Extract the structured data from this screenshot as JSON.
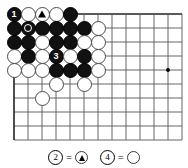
{
  "figure": {
    "kind": "go-board-diagram",
    "board": {
      "cols": 13,
      "rows": 10,
      "origin_x": 14,
      "origin_y": 14,
      "spacing": 14,
      "line_color": "#555555",
      "edge_color": "#222222",
      "background": "#ffffff",
      "star_points": [
        {
          "col": 11,
          "row": 4
        }
      ]
    },
    "stones": [
      {
        "col": 1,
        "row": 1,
        "color": "black",
        "label": "1",
        "mark": "number"
      },
      {
        "col": 2,
        "row": 1,
        "color": "white",
        "label": "",
        "mark": "none"
      },
      {
        "col": 3,
        "row": 1,
        "color": "white",
        "label": "",
        "mark": "triangle"
      },
      {
        "col": 4,
        "row": 1,
        "color": "white",
        "label": "",
        "mark": "none"
      },
      {
        "col": 5,
        "row": 1,
        "color": "black",
        "label": "",
        "mark": "none"
      },
      {
        "col": 1,
        "row": 2,
        "color": "black",
        "label": "",
        "mark": "none"
      },
      {
        "col": 2,
        "row": 2,
        "color": "black",
        "label": "",
        "mark": "circle"
      },
      {
        "col": 3,
        "row": 2,
        "color": "black",
        "label": "",
        "mark": "none"
      },
      {
        "col": 4,
        "row": 2,
        "color": "black",
        "label": "",
        "mark": "none"
      },
      {
        "col": 5,
        "row": 2,
        "color": "black",
        "label": "",
        "mark": "none"
      },
      {
        "col": 6,
        "row": 2,
        "color": "black",
        "label": "",
        "mark": "none"
      },
      {
        "col": 7,
        "row": 2,
        "color": "white",
        "label": "",
        "mark": "none"
      },
      {
        "col": 1,
        "row": 3,
        "color": "black",
        "label": "",
        "mark": "none"
      },
      {
        "col": 2,
        "row": 3,
        "color": "black",
        "label": "",
        "mark": "none"
      },
      {
        "col": 3,
        "row": 3,
        "color": "white",
        "label": "",
        "mark": "none"
      },
      {
        "col": 4,
        "row": 3,
        "color": "black",
        "label": "",
        "mark": "none"
      },
      {
        "col": 5,
        "row": 3,
        "color": "black",
        "label": "",
        "mark": "none"
      },
      {
        "col": 6,
        "row": 3,
        "color": "white",
        "label": "",
        "mark": "none"
      },
      {
        "col": 7,
        "row": 3,
        "color": "white",
        "label": "",
        "mark": "none"
      },
      {
        "col": 1,
        "row": 4,
        "color": "white",
        "label": "",
        "mark": "none"
      },
      {
        "col": 2,
        "row": 4,
        "color": "black",
        "label": "",
        "mark": "none"
      },
      {
        "col": 3,
        "row": 4,
        "color": "white",
        "label": "",
        "mark": "none"
      },
      {
        "col": 4,
        "row": 4,
        "color": "black",
        "label": "3",
        "mark": "number"
      },
      {
        "col": 5,
        "row": 4,
        "color": "white",
        "label": "",
        "mark": "none"
      },
      {
        "col": 6,
        "row": 4,
        "color": "black",
        "label": "",
        "mark": "none"
      },
      {
        "col": 7,
        "row": 4,
        "color": "white",
        "label": "",
        "mark": "none"
      },
      {
        "col": 1,
        "row": 5,
        "color": "white",
        "label": "",
        "mark": "none"
      },
      {
        "col": 2,
        "row": 5,
        "color": "white",
        "label": "",
        "mark": "none"
      },
      {
        "col": 3,
        "row": 5,
        "color": "white",
        "label": "",
        "mark": "none"
      },
      {
        "col": 4,
        "row": 5,
        "color": "black",
        "label": "",
        "mark": "none"
      },
      {
        "col": 5,
        "row": 5,
        "color": "black",
        "label": "",
        "mark": "none"
      },
      {
        "col": 6,
        "row": 5,
        "color": "black",
        "label": "",
        "mark": "none"
      },
      {
        "col": 7,
        "row": 5,
        "color": "white",
        "label": "",
        "mark": "none"
      },
      {
        "col": 4,
        "row": 6,
        "color": "white",
        "label": "",
        "mark": "none"
      },
      {
        "col": 6,
        "row": 6,
        "color": "white",
        "label": "",
        "mark": "none"
      },
      {
        "col": 3,
        "row": 7,
        "color": "white",
        "label": "",
        "mark": "none"
      }
    ]
  },
  "caption": {
    "items": [
      {
        "number": "2",
        "equals": "=",
        "symbol": "white-stone-triangle"
      },
      {
        "number": "4",
        "equals": "=",
        "symbol": "white-stone-plain"
      }
    ]
  }
}
